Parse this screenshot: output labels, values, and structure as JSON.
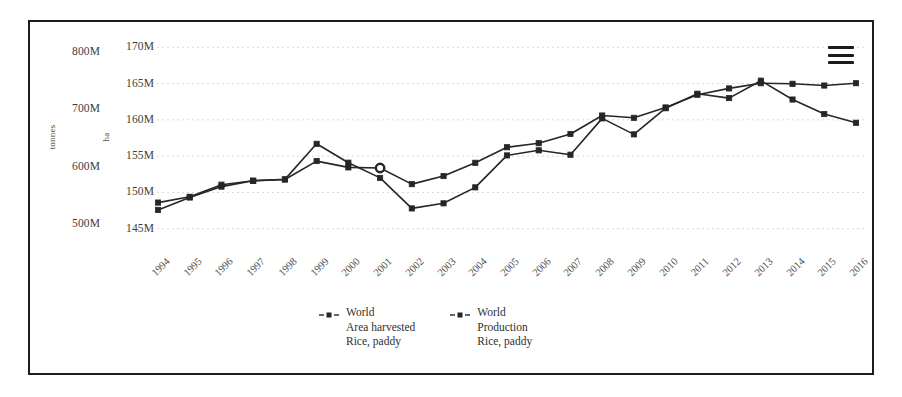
{
  "chart_data": {
    "type": "line",
    "title": "",
    "xlabel": "",
    "ylabel": "tonnes",
    "y2label": "ha",
    "grid": true,
    "legend_position": "bottom-center",
    "categories": [
      1994,
      1995,
      1996,
      1997,
      1998,
      1999,
      2000,
      2001,
      2002,
      2003,
      2004,
      2005,
      2006,
      2007,
      2008,
      2009,
      2010,
      2011,
      2012,
      2013,
      2014,
      2015,
      2016
    ],
    "x_tick_labels": [
      "1994",
      "1995",
      "1996",
      "1997",
      "1998",
      "1999",
      "2000",
      "2001",
      "2002",
      "2003",
      "2004",
      "2005",
      "2006",
      "2007",
      "2008",
      "2009",
      "2010",
      "2011",
      "2012",
      "2013",
      "2014",
      "2015",
      "2016"
    ],
    "y_axes": [
      {
        "id": "left",
        "label": "tonnes",
        "tick_labels": [
          "800M",
          "700M",
          "600M",
          "500M"
        ],
        "tick_values": [
          800000000,
          700000000,
          600000000,
          500000000
        ],
        "ylim": [
          480000000,
          820000000
        ]
      },
      {
        "id": "right",
        "label": "ha",
        "tick_labels": [
          "170M",
          "165M",
          "160M",
          "155M",
          "150M",
          "145M"
        ],
        "tick_values": [
          170000000,
          165000000,
          160000000,
          155000000,
          150000000,
          145000000
        ],
        "ylim": [
          144000000,
          171000000
        ]
      }
    ],
    "series": [
      {
        "name": "World Area harvested Rice, paddy",
        "legend_lines": [
          "World",
          "Area harvested",
          "Rice, paddy"
        ],
        "axis": "right",
        "unit": "ha",
        "color": "#262626",
        "marker": "square",
        "values": [
          147600000,
          149300000,
          150800000,
          151600000,
          151800000,
          156700000,
          154100000,
          152000000,
          147800000,
          148500000,
          150700000,
          155100000,
          155800000,
          155200000,
          160200000,
          158000000,
          161600000,
          163600000,
          163000000,
          165400000,
          162800000,
          160800000,
          159600000
        ]
      },
      {
        "name": "World Production Rice, paddy",
        "legend_lines": [
          "World",
          "Production",
          "Rice, paddy"
        ],
        "axis": "left",
        "unit": "tonnes",
        "color": "#262626",
        "marker": "square",
        "values": [
          538000000,
          548000000,
          569000000,
          576000000,
          578000000,
          610000000,
          599000000,
          598000000,
          570000000,
          584000000,
          607000000,
          634000000,
          641000000,
          657000000,
          689000000,
          685000000,
          703000000,
          725000000,
          736000000,
          745000000,
          744000000,
          741000000,
          745000000
        ]
      }
    ],
    "highlighted_point": {
      "series": "World Production Rice, paddy",
      "category": "2001",
      "marker": "circle-outline"
    }
  },
  "toolbar": {
    "menu_label": "Chart context menu",
    "menu_icon": "hamburger-menu-icon"
  },
  "legend": {
    "entries": [
      {
        "lines": [
          "World",
          "Area harvested",
          "Rice, paddy"
        ]
      },
      {
        "lines": [
          "World",
          "Production",
          "Rice, paddy"
        ]
      }
    ]
  }
}
